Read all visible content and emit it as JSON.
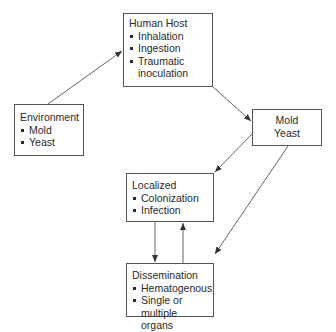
{
  "diagram": {
    "nodes": {
      "human_host": {
        "title": "Human Host",
        "items": [
          "Inhalation",
          "Ingestion",
          "Traumatic inoculation"
        ]
      },
      "environment": {
        "title": "Environment",
        "items": [
          "Mold",
          "Yeast"
        ]
      },
      "mold_yeast": {
        "lines": [
          "Mold",
          "Yeast"
        ]
      },
      "localized": {
        "title": "Localized",
        "items": [
          "Colonization",
          "Infection"
        ]
      },
      "dissemination": {
        "title": "Dissemination",
        "items": [
          "Hematogenous",
          "Single or multiple organs"
        ]
      }
    },
    "edges": [
      {
        "from": "environment",
        "to": "human_host"
      },
      {
        "from": "human_host",
        "to": "mold_yeast"
      },
      {
        "from": "mold_yeast",
        "to": "localized"
      },
      {
        "from": "mold_yeast",
        "to": "dissemination"
      },
      {
        "from": "localized",
        "to": "dissemination"
      },
      {
        "from": "dissemination",
        "to": "localized"
      }
    ],
    "colors": {
      "line": "#555555",
      "text": "#2a2a2a",
      "background": "#ffffff"
    }
  }
}
